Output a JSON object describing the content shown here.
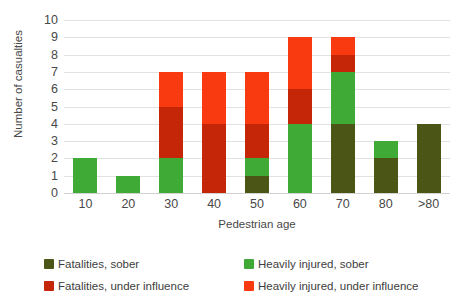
{
  "chart_data": {
    "type": "bar",
    "stacked": true,
    "title": "",
    "xlabel": "Pedestrian age",
    "ylabel": "Number of casualties",
    "categories": [
      "10",
      "20",
      "30",
      "40",
      "50",
      "60",
      "70",
      "80",
      ">80"
    ],
    "ylim": [
      0,
      10
    ],
    "yticks": [
      0,
      1,
      2,
      3,
      4,
      5,
      6,
      7,
      8,
      9,
      10
    ],
    "grid": true,
    "legend_position": "bottom",
    "series": [
      {
        "name": "Fatalities, sober",
        "color": "#4a5516",
        "values": [
          0,
          0,
          0,
          0,
          1,
          0,
          4,
          2,
          4
        ]
      },
      {
        "name": "Heavily injured, sober",
        "color": "#3faa35",
        "values": [
          2,
          1,
          2,
          0,
          1,
          4,
          3,
          1,
          0
        ]
      },
      {
        "name": "Fatalities, under influence",
        "color": "#c62608",
        "values": [
          0,
          0,
          3,
          4,
          2,
          2,
          1,
          0,
          0
        ]
      },
      {
        "name": "Heavily injured, under influence",
        "color": "#f93a10",
        "values": [
          0,
          0,
          2,
          3,
          3,
          3,
          1,
          0,
          0
        ]
      }
    ],
    "totals": [
      2,
      1,
      7,
      7,
      7,
      9,
      9,
      3,
      4
    ]
  },
  "legend": {
    "items": [
      {
        "label": "Fatalities, sober",
        "color": "#4a5516"
      },
      {
        "label": "Heavily injured, sober",
        "color": "#3faa35"
      },
      {
        "label": "Fatalities, under influence",
        "color": "#c62608"
      },
      {
        "label": "Heavily injured, under influence",
        "color": "#f93a10"
      }
    ]
  }
}
